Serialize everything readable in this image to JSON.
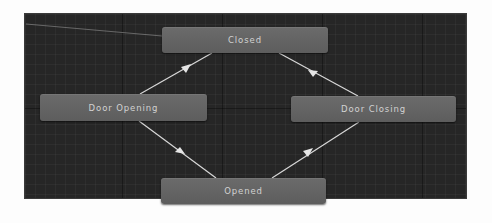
{
  "graph": {
    "states": [
      {
        "id": "closed",
        "label": "Closed"
      },
      {
        "id": "door_opening",
        "label": "Door Opening"
      },
      {
        "id": "door_closing",
        "label": "Door Closing"
      },
      {
        "id": "opened",
        "label": "Opened"
      }
    ],
    "transitions": [
      {
        "from": "entry",
        "to": "closed"
      },
      {
        "from": "door_opening",
        "to": "closed"
      },
      {
        "from": "door_closing",
        "to": "closed"
      },
      {
        "from": "door_opening",
        "to": "opened"
      },
      {
        "from": "opened",
        "to": "door_closing"
      }
    ]
  },
  "colors": {
    "canvas_bg": "#262626",
    "node_fill": "#646464",
    "node_text": "#d2d2d2",
    "link": "#d8d8d8"
  }
}
